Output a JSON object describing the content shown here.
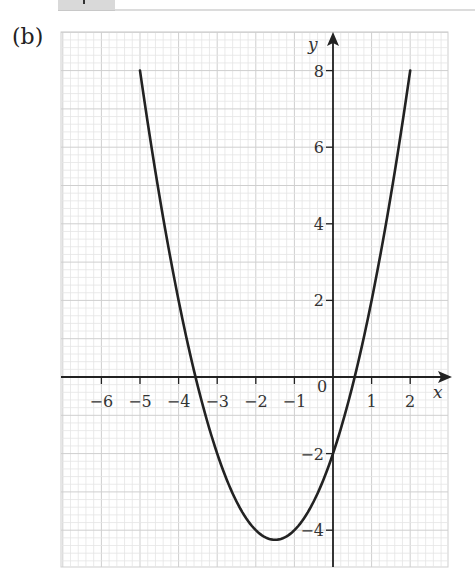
{
  "page": {
    "part_label": "(b)"
  },
  "chart_data": {
    "type": "line",
    "title": "",
    "xlabel": "x",
    "ylabel": "y",
    "function": "y = x^2 + 3x - 2",
    "xlim": [
      -7,
      3
    ],
    "ylim": [
      -5,
      9
    ],
    "x_ticks": [
      -6,
      -5,
      -4,
      -3,
      -2,
      -1,
      1,
      2
    ],
    "x_tick_labels": [
      "−6",
      "−5",
      "−4",
      "−3",
      "−2",
      "−1",
      "1",
      "2"
    ],
    "origin_label": "0",
    "y_ticks": [
      8,
      6,
      4,
      2,
      -2,
      -4
    ],
    "y_tick_labels": [
      "8",
      "6",
      "4",
      "2",
      "−2",
      "−4"
    ],
    "grid": true,
    "grid_minor_per_unit": 5,
    "series": [
      {
        "name": "parabola",
        "domain": [
          -5,
          2
        ],
        "coefficients": {
          "a": 1,
          "b": 3,
          "c": -2
        },
        "x": [
          -5,
          -4.5,
          -4,
          -3.5,
          -3,
          -2.5,
          -2,
          -1.5,
          -1,
          -0.5,
          0,
          0.5,
          1,
          1.5,
          2
        ],
        "y": [
          8,
          5.75,
          2,
          -0.25,
          -2,
          -3.25,
          -4,
          -4.25,
          -4,
          -3.25,
          -2,
          -0.25,
          2,
          4.25,
          8
        ]
      }
    ],
    "key_points": {
      "vertex": [
        -1.5,
        -4.25
      ],
      "roots": [
        -3.56,
        0.56
      ],
      "y_intercept": [
        0,
        -2
      ]
    },
    "colors": {
      "curve": "#222222",
      "axes": "#222222",
      "grid_minor": "#e4e4e4",
      "grid_major": "#cfcfcf"
    }
  }
}
